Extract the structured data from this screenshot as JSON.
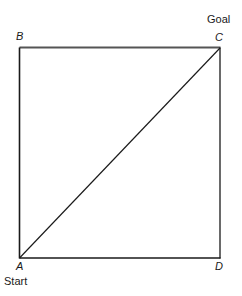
{
  "figure": {
    "title": "",
    "type": "geometry-diagram",
    "background_color": "#ffffff",
    "stroke_color": "#1a1a1a",
    "top_edge_color": "#555555",
    "vertices": [
      {
        "id": "A",
        "label": "A",
        "x": 19,
        "y": 258,
        "annotation": "Start"
      },
      {
        "id": "B",
        "label": "B",
        "x": 19,
        "y": 48,
        "annotation": ""
      },
      {
        "id": "C",
        "label": "C",
        "x": 220,
        "y": 48,
        "annotation": "Goal"
      },
      {
        "id": "D",
        "label": "D",
        "x": 220,
        "y": 258,
        "annotation": ""
      }
    ],
    "annotations": {
      "start": "Start",
      "goal": "Goal"
    },
    "edges": [
      {
        "from": "B",
        "to": "C",
        "kind": "square-side-top"
      },
      {
        "from": "C",
        "to": "D",
        "kind": "square-side-right"
      },
      {
        "from": "D",
        "to": "A",
        "kind": "square-side-bottom"
      },
      {
        "from": "A",
        "to": "B",
        "kind": "square-side-left"
      },
      {
        "from": "A",
        "to": "C",
        "kind": "diagonal"
      }
    ]
  }
}
